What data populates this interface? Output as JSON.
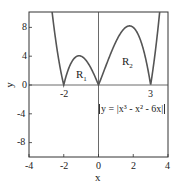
{
  "chart_data": {
    "type": "line",
    "title": "",
    "xlabel": "x",
    "ylabel": "y",
    "xlim": [
      -4,
      4
    ],
    "ylim": [
      -10.5,
      10
    ],
    "xticks": [
      -4,
      -2,
      0,
      2,
      4
    ],
    "yticks": [
      8,
      4,
      0,
      -4,
      -8
    ],
    "xtick_labels": [
      "-4",
      "-2",
      "0",
      "2",
      "4"
    ],
    "ytick_labels": [
      "8",
      "4",
      "0",
      "-4",
      "-8"
    ],
    "grid": false,
    "series": [
      {
        "name": "y = |x^3 - x^2 - 6x|",
        "x": [
          -2.6,
          -2.4,
          -2.2,
          -2.0,
          -1.6,
          -1.2,
          -0.8,
          -0.4,
          0.0,
          0.4,
          0.8,
          1.2,
          1.6,
          2.0,
          2.4,
          2.8,
          3.0,
          3.2,
          3.4,
          3.6
        ],
        "y": [
          9.84,
          5.28,
          2.09,
          0.0,
          2.94,
          4.03,
          3.58,
          2.02,
          0.0,
          2.42,
          4.93,
          7.06,
          8.1,
          8.0,
          6.34,
          3.42,
          0.0,
          3.46,
          7.48,
          12.1
        ]
      }
    ],
    "annotations": [
      {
        "text": "R",
        "sub": "1",
        "x": -1.0,
        "y": 1.5
      },
      {
        "text": "R",
        "sub": "2",
        "x": 1.6,
        "y": 3.5
      },
      {
        "text": "-2",
        "x": -2.0,
        "y": -1.0
      },
      {
        "text": "3",
        "x": 3.0,
        "y": -1.0
      },
      {
        "text": "y = |x³ - x² - 6x|",
        "x": 2.0,
        "y": -3.4,
        "boxed": true
      }
    ]
  },
  "labels": {
    "xlabel": "x",
    "ylabel": "y",
    "xticks": [
      "-4",
      "-2",
      "0",
      "2",
      "4"
    ],
    "yticks": [
      "8",
      "4",
      "0",
      "-4",
      "-8"
    ],
    "r1": "R",
    "r1_sub": "1",
    "r2": "R",
    "r2_sub": "2",
    "root_neg2": "-2",
    "root_3": "3",
    "equation": "y = |x³ - x² - 6x|"
  }
}
